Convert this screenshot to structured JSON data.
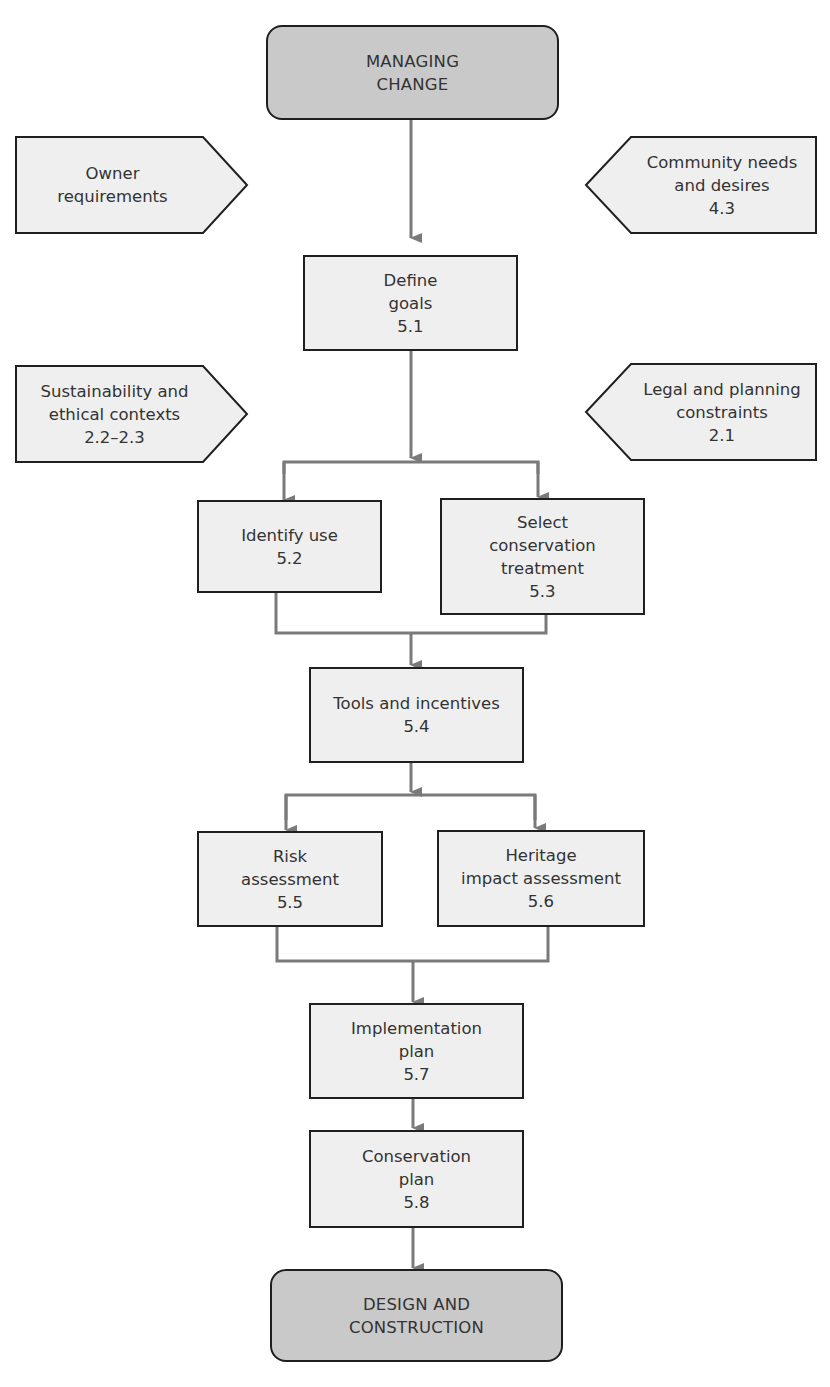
{
  "diagram": {
    "start": {
      "line1": "MANAGING",
      "line2": "CHANGE"
    },
    "inputs": {
      "owner": {
        "line1": "Owner",
        "line2": "requirements"
      },
      "community": {
        "line1": "Community needs",
        "line2": "and desires",
        "ref": "4.3"
      },
      "sustainability": {
        "line1": "Sustainability and",
        "line2": "ethical contexts",
        "ref": "2.2–2.3"
      },
      "legal": {
        "line1": "Legal and planning",
        "line2": "constraints",
        "ref": "2.1"
      }
    },
    "steps": {
      "define_goals": {
        "line1": "Define",
        "line2": "goals",
        "ref": "5.1"
      },
      "identify_use": {
        "line1": "Identify use",
        "ref": "5.2"
      },
      "select_treatment": {
        "line1": "Select",
        "line2": "conservation",
        "line3": "treatment",
        "ref": "5.3"
      },
      "tools": {
        "line1": "Tools and incentives",
        "ref": "5.4"
      },
      "risk": {
        "line1": "Risk",
        "line2": "assessment",
        "ref": "5.5"
      },
      "heritage": {
        "line1": "Heritage",
        "line2": "impact assessment",
        "ref": "5.6"
      },
      "implementation": {
        "line1": "Implementation",
        "line2": "plan",
        "ref": "5.7"
      },
      "conservation_plan": {
        "line1": "Conservation",
        "line2": "plan",
        "ref": "5.8"
      }
    },
    "end": {
      "line1": "DESIGN AND",
      "line2": "CONSTRUCTION"
    }
  },
  "colors": {
    "terminal_fill": "#c9c9c9",
    "box_fill": "#efefef",
    "border": "#1f1f1f",
    "connector": "#7a7a7a"
  }
}
